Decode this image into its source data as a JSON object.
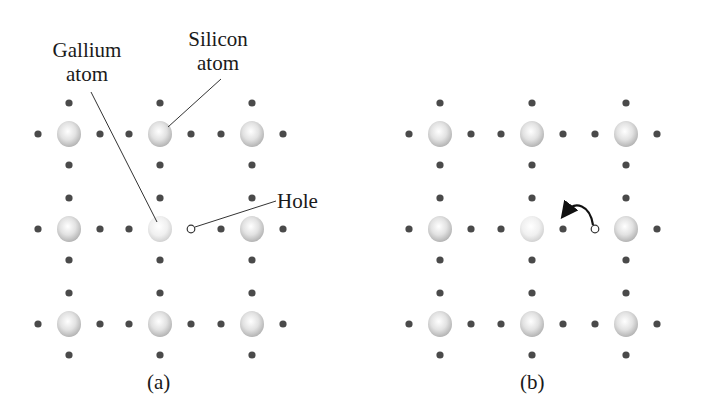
{
  "labels": {
    "gallium": {
      "line1": "Gallium",
      "line2": "atom"
    },
    "silicon": {
      "line1": "Silicon",
      "line2": "atom"
    },
    "hole": "Hole"
  },
  "captions": {
    "a": "(a)",
    "b": "(b)"
  },
  "colors": {
    "electron": "#4a4a4a",
    "atom_fill_light": "#f4f4f4",
    "atom_fill_dark": "#b9b9b9",
    "gallium_fill": "#ececec",
    "leader_line": "#333333",
    "text": "#1a1a1a"
  },
  "panels": [
    {
      "id": "a",
      "atom_cols_x": [
        69,
        160,
        252
      ],
      "atom_rows_y": [
        134,
        229,
        324
      ],
      "gallium_pos": [
        160,
        229
      ],
      "hole_pos": [
        191,
        229
      ]
    },
    {
      "id": "b",
      "atom_cols_x": [
        440,
        532,
        626
      ],
      "atom_rows_y": [
        134,
        229,
        324
      ],
      "gallium_pos": [
        532,
        229
      ],
      "hole_pos": [
        595,
        229
      ],
      "arrow": "hole moves left (electron jumps right)"
    }
  ]
}
